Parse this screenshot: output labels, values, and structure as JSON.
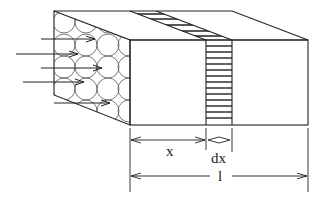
{
  "diagram": {
    "labels": {
      "x": "x",
      "dx": "dx",
      "l": "l"
    },
    "colors": {
      "stroke": "#222222",
      "circles": "#555555",
      "background": "#ffffff"
    },
    "flow_arrows_count": 5,
    "slice_stripes_count": 14
  }
}
